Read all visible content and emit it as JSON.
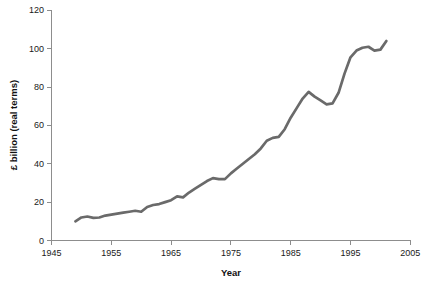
{
  "chart_data": {
    "type": "line",
    "title": "",
    "xlabel": "Year",
    "ylabel": "£ billion (real terms)",
    "xlim": [
      1945,
      2005
    ],
    "ylim": [
      0,
      120
    ],
    "xticks": [
      1945,
      1955,
      1965,
      1975,
      1985,
      1995,
      2005
    ],
    "xtick_labels": [
      "1945",
      "1955",
      "1965",
      "1975",
      "1985",
      "1995",
      "2005"
    ],
    "yticks": [
      0,
      20,
      40,
      60,
      80,
      100,
      120
    ],
    "ytick_labels": [
      "0",
      "20",
      "40",
      "60",
      "80",
      "100",
      "120"
    ],
    "grid": false,
    "legend": null,
    "series": [
      {
        "name": "£ billion (real terms)",
        "color": "#6a6a6a",
        "x": [
          1949,
          1950,
          1951,
          1952,
          1953,
          1954,
          1955,
          1956,
          1957,
          1958,
          1959,
          1960,
          1961,
          1962,
          1963,
          1964,
          1965,
          1966,
          1967,
          1968,
          1969,
          1970,
          1971,
          1972,
          1973,
          1974,
          1975,
          1976,
          1977,
          1978,
          1979,
          1980,
          1981,
          1982,
          1983,
          1984,
          1985,
          1986,
          1987,
          1988,
          1989,
          1990,
          1991,
          1992,
          1993,
          1994,
          1995,
          1996,
          1997,
          1998,
          1999,
          2000,
          2001
        ],
        "values": [
          10,
          12,
          12.5,
          11.8,
          12,
          13,
          13.5,
          14,
          14.5,
          15,
          15.5,
          15,
          17.5,
          18.5,
          19,
          20,
          21,
          23,
          22.5,
          25,
          27,
          29,
          31,
          32.5,
          32,
          32,
          35,
          37.5,
          40,
          42.5,
          45,
          48,
          52,
          53.5,
          54,
          58,
          64,
          69,
          74,
          77.5,
          75,
          73,
          71,
          71.5,
          77,
          87,
          95.5,
          99,
          100.5,
          101,
          99,
          99.5,
          104
        ]
      }
    ]
  },
  "axes": {
    "y_axis_name": "y-axis",
    "x_axis_name": "x-axis"
  }
}
